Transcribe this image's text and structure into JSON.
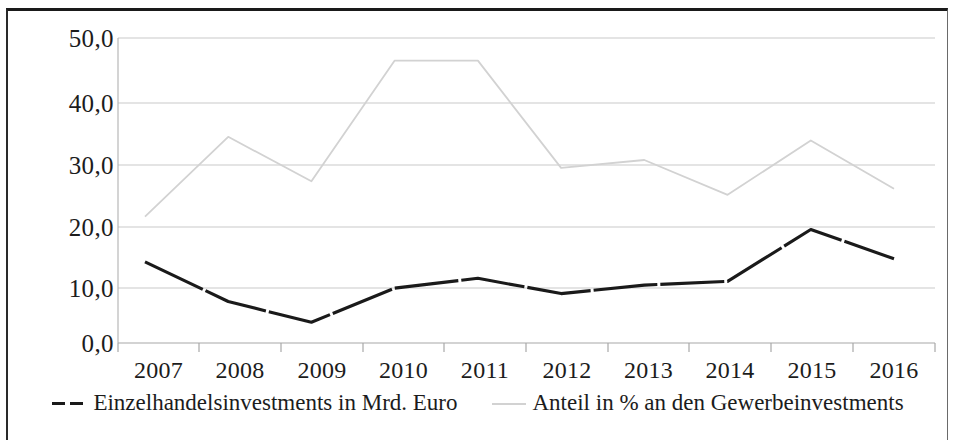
{
  "chart_data": {
    "type": "line",
    "title": "",
    "xlabel": "",
    "ylabel": "",
    "categories": [
      "2007",
      "2008",
      "2009",
      "2010",
      "2011",
      "2012",
      "2013",
      "2014",
      "2015",
      "2016"
    ],
    "ylim": [
      0,
      50
    ],
    "yticks": [
      0,
      10,
      20,
      30,
      40,
      50
    ],
    "ytick_labels": [
      "0,0",
      "10,0",
      "20,0",
      "30,0",
      "40,0",
      "50,0"
    ],
    "grid": true,
    "legend_position": "bottom",
    "series": [
      {
        "name": "Einzelhandelsinvestments in Mrd. Euro",
        "style": "dashed",
        "color": "#1a1a1a",
        "values": [
          13.3,
          6.8,
          3.4,
          9.0,
          10.6,
          8.1,
          9.5,
          10.1,
          18.6,
          13.8
        ]
      },
      {
        "name": "Anteil in % an den Gewerbeinvestments",
        "style": "solid",
        "color": "#d2d2d2",
        "values": [
          20.7,
          33.8,
          26.5,
          46.3,
          46.3,
          28.7,
          30.0,
          24.3,
          33.2,
          25.3
        ]
      }
    ]
  },
  "axis": {
    "ytick_labels": [
      "50,0",
      "40,0",
      "30,0",
      "20,0",
      "10,0",
      "0,0"
    ],
    "xtick_labels": [
      "2007",
      "2008",
      "2009",
      "2010",
      "2011",
      "2012",
      "2013",
      "2014",
      "2015",
      "2016"
    ]
  },
  "legend": {
    "items": [
      {
        "label": "Einzelhandelsinvestments in Mrd. Euro",
        "marker": "dashed-line-marker"
      },
      {
        "label": "Anteil in % an den Gewerbeinvestments",
        "marker": "solid-line-marker"
      }
    ]
  },
  "colors": {
    "series_dark": "#1a1a1a",
    "series_light": "#d2d2d2",
    "gridline": "#c9c9c9",
    "text": "#1c1c1c",
    "background": "#ffffff"
  }
}
